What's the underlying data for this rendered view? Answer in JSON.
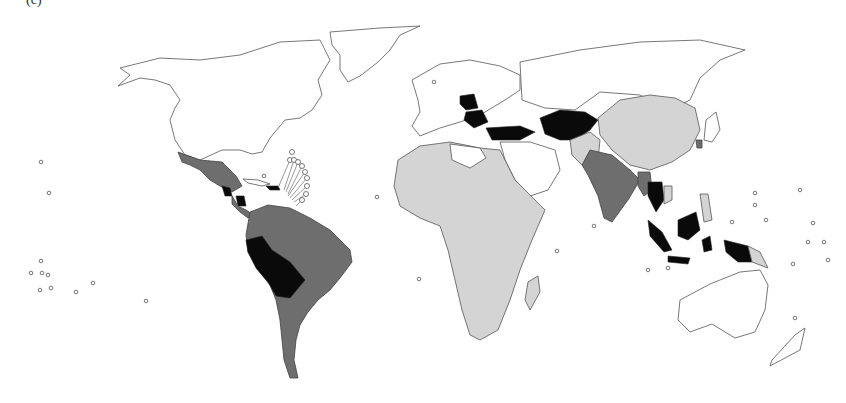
{
  "figure": {
    "title": "(c)",
    "type": "choropleth world map"
  },
  "map": {
    "fill_classes": [
      {
        "id": "none",
        "color": "#ffffff"
      },
      {
        "id": "light",
        "color": "#d4d4d4"
      },
      {
        "id": "medium",
        "color": "#6e6e6e"
      },
      {
        "id": "dark",
        "color": "#0a0a0a"
      }
    ],
    "regions": {
      "light": [
        "Sub-Saharan & North-West Africa",
        "China",
        "Mongolia",
        "Pakistan",
        "Afghanistan",
        "Vietnam",
        "Philippines",
        "Papua New Guinea",
        "Madagascar"
      ],
      "medium": [
        "Mexico",
        "Central America",
        "Colombia",
        "Venezuela",
        "Brazil",
        "Argentina",
        "Chile",
        "India",
        "Bangladesh",
        "Myanmar",
        "South Korea"
      ],
      "dark": [
        "Poland",
        "Balkans/Romania",
        "Turkey",
        "Iran/Central Asia",
        "Peru",
        "Bolivia",
        "Thailand",
        "Indonesia",
        "Guatemala",
        "Nicaragua",
        "Hispaniola"
      ]
    }
  }
}
